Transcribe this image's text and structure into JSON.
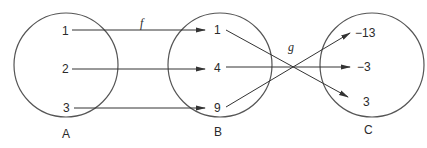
{
  "diagram": {
    "type": "function-composition-mapping",
    "sets": [
      {
        "name": "A",
        "elements": [
          "1",
          "2",
          "3"
        ]
      },
      {
        "name": "B",
        "elements": [
          "1",
          "4",
          "9"
        ]
      },
      {
        "name": "C",
        "elements": [
          "−13",
          "−3",
          "3"
        ]
      }
    ],
    "functions": [
      {
        "name": "f",
        "from": "A",
        "to": "B",
        "mappings": [
          [
            "1",
            "1"
          ],
          [
            "2",
            "4"
          ],
          [
            "3",
            "9"
          ]
        ]
      },
      {
        "name": "g",
        "from": "B",
        "to": "C",
        "mappings": [
          [
            "1",
            "3"
          ],
          [
            "4",
            "−3"
          ],
          [
            "9",
            "−13"
          ]
        ]
      }
    ],
    "labels": {
      "set_a": "A",
      "set_b": "B",
      "set_c": "C",
      "f": "f",
      "g": "g",
      "a1": "1",
      "a2": "2",
      "a3": "3",
      "b1": "1",
      "b4": "4",
      "b9": "9",
      "c_neg13": "−13",
      "c_neg3": "−3",
      "c3": "3"
    },
    "colors": {
      "stroke": "#555555",
      "text": "#2a2a2a",
      "background": "#ffffff"
    }
  }
}
